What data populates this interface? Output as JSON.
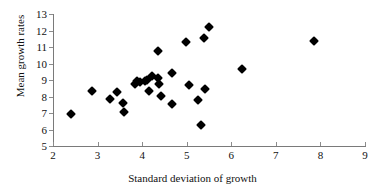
{
  "chart_data": {
    "type": "scatter",
    "title": "",
    "xlabel": "Standard deviation of growth",
    "ylabel": "Mean growth rates",
    "xlim": [
      2,
      9
    ],
    "ylim": [
      5,
      13
    ],
    "xticks": [
      2,
      3,
      4,
      5,
      6,
      7,
      8,
      9
    ],
    "yticks": [
      5,
      6,
      7,
      8,
      9,
      10,
      11,
      12,
      13
    ],
    "grid": false,
    "legend": null,
    "marker": "filled-diamond",
    "marker_color": "#000000",
    "points": [
      {
        "x": 2.41,
        "y": 6.95
      },
      {
        "x": 2.88,
        "y": 8.33
      },
      {
        "x": 3.28,
        "y": 7.85
      },
      {
        "x": 3.44,
        "y": 8.28
      },
      {
        "x": 3.58,
        "y": 7.63
      },
      {
        "x": 3.6,
        "y": 7.05
      },
      {
        "x": 3.83,
        "y": 8.78
      },
      {
        "x": 3.88,
        "y": 8.95
      },
      {
        "x": 3.95,
        "y": 8.88
      },
      {
        "x": 4.06,
        "y": 8.95
      },
      {
        "x": 4.12,
        "y": 9.0
      },
      {
        "x": 4.16,
        "y": 8.33
      },
      {
        "x": 4.22,
        "y": 9.22
      },
      {
        "x": 4.35,
        "y": 10.73
      },
      {
        "x": 4.36,
        "y": 9.1
      },
      {
        "x": 4.38,
        "y": 8.78
      },
      {
        "x": 4.42,
        "y": 8.02
      },
      {
        "x": 4.66,
        "y": 9.42
      },
      {
        "x": 4.68,
        "y": 7.52
      },
      {
        "x": 4.99,
        "y": 11.32
      },
      {
        "x": 5.05,
        "y": 8.72
      },
      {
        "x": 5.25,
        "y": 7.78
      },
      {
        "x": 5.31,
        "y": 6.28
      },
      {
        "x": 5.38,
        "y": 11.52
      },
      {
        "x": 5.41,
        "y": 8.45
      },
      {
        "x": 5.49,
        "y": 12.2
      },
      {
        "x": 6.24,
        "y": 9.67
      },
      {
        "x": 7.86,
        "y": 11.34
      }
    ]
  },
  "axes": {
    "x_tick_labels": [
      "2",
      "3",
      "4",
      "5",
      "6",
      "7",
      "8",
      "9"
    ],
    "y_tick_labels": [
      "5",
      "6",
      "7",
      "8",
      "9",
      "10",
      "11",
      "12",
      "13"
    ]
  }
}
